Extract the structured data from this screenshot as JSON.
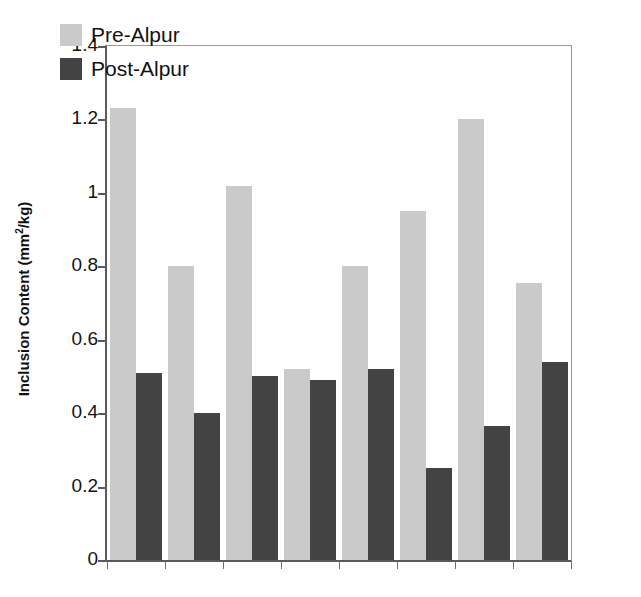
{
  "chart_data": {
    "type": "bar",
    "title": "",
    "subtitle": "",
    "xlabel": "",
    "ylabel": "Inclusion Content (mm2/kg)",
    "ylabel_parts": {
      "prefix": "Inclusion Content (mm",
      "sup": "2",
      "suffix": "/kg)"
    },
    "ylim": [
      0,
      1.4
    ],
    "yticks": [
      0,
      0.2,
      0.4,
      0.6,
      0.8,
      1,
      1.2,
      1.4
    ],
    "ytick_labels": [
      "0",
      "0.2",
      "0.4",
      "0.6",
      "0.8",
      "1",
      "1.2",
      "1.4"
    ],
    "xtick_labels": [
      "",
      "",
      "",
      "",
      "",
      "",
      "",
      ""
    ],
    "grid": false,
    "legend_position": "upper-left-inside",
    "categories": [
      "1",
      "2",
      "3",
      "4",
      "5",
      "6",
      "7",
      "8"
    ],
    "series": [
      {
        "name": "Pre-Alpur",
        "color": "#cacaca",
        "values": [
          1.23,
          0.8,
          1.02,
          0.52,
          0.8,
          0.95,
          1.2,
          0.755
        ]
      },
      {
        "name": "Post-Alpur",
        "color": "#434343",
        "values": [
          0.51,
          0.4,
          0.5,
          0.49,
          0.52,
          0.25,
          0.365,
          0.54
        ]
      }
    ]
  },
  "legend": {
    "items": [
      {
        "label": "Pre-Alpur",
        "color": "#cacaca"
      },
      {
        "label": "Post-Alpur",
        "color": "#434343"
      }
    ]
  },
  "colors": {
    "pre": "#cacaca",
    "post": "#434343",
    "axis": "#5a5a5a",
    "frame": "#9a9a9a",
    "text": "#111111",
    "background": "#ffffff"
  }
}
